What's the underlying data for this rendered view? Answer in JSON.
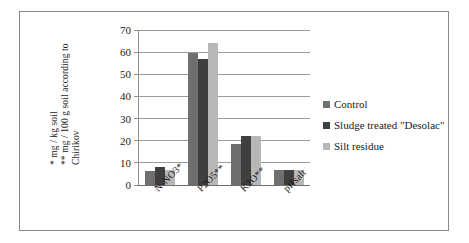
{
  "chart_data": {
    "type": "bar",
    "title": "",
    "subtitle": "",
    "xlabel": "",
    "ylabel": "* mg / kg soil  ** mg / 100 g soil according to Chirikov",
    "ylabel_lines": [
      "* mg / kg soil",
      "** mg / 100 g soil according to",
      "Chirikov"
    ],
    "categories": [
      "N-NO3*",
      "P2O5**",
      "K2O**",
      "pHsalt"
    ],
    "series": [
      {
        "name": "Control",
        "values": [
          6.5,
          59.5,
          18.5,
          6.8
        ],
        "color": "#6f6f6f"
      },
      {
        "name": "Sludge treated \"Desolac\"",
        "values": [
          8.0,
          57.0,
          22.0,
          6.9
        ],
        "color": "#3f3f3f"
      },
      {
        "name": "Silt residue",
        "values": [
          7.0,
          64.0,
          22.0,
          6.7
        ],
        "color": "#b7b7b7"
      }
    ],
    "ylim": [
      0,
      70
    ],
    "yticks": [
      0,
      10,
      20,
      30,
      40,
      50,
      60,
      70
    ],
    "ytick_labels": [
      "0",
      "10",
      "20",
      "30",
      "40",
      "50",
      "60",
      "70"
    ],
    "grid": true,
    "grid_axis": "y",
    "legend_position": "right",
    "frame": true
  },
  "legend": {
    "items": [
      {
        "label": "Control"
      },
      {
        "label": "Sludge treated \"Desolac\""
      },
      {
        "label": "Silt residue"
      }
    ]
  }
}
